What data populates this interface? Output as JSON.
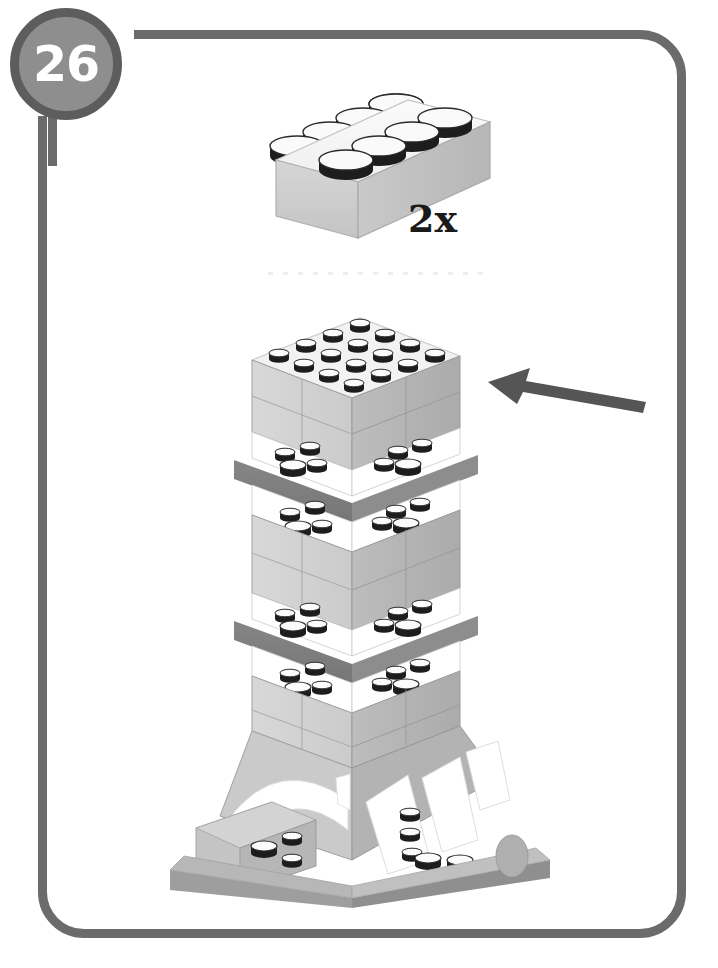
{
  "page": {
    "kind": "lego-building-instruction-step",
    "background_color": "#ffffff"
  },
  "frame": {
    "name": "rounded-step-frame",
    "color": "#6b6b6b",
    "stroke_width_px": 9,
    "corner_radius_px": 46
  },
  "step_badge": {
    "number": "26",
    "fill_color": "#8e8e8e",
    "ring_color": "#5d5d5d",
    "text_color": "#ffffff"
  },
  "parts_callout": {
    "quantity_label": "2x",
    "quantity_text_color": "#1a1a1a",
    "part": {
      "name": "brick-2x4",
      "studs_long": 4,
      "studs_wide": 2,
      "color_name": "light-gray",
      "body_color": "#cfcfcf",
      "top_color": "#f4f4f4",
      "stud_outline_color": "#141414"
    }
  },
  "separator": {
    "name": "dotted-divider",
    "color": "#eeeeee"
  },
  "arrow": {
    "name": "placement-arrow",
    "direction": "left",
    "color": "#555555",
    "points_to": "tower-top-section"
  },
  "assembly": {
    "name": "eiffel-tower-model",
    "top_section": {
      "stud_grid_rows": 4,
      "stud_grid_cols": 4,
      "top_plate_color": "#f2f2f2"
    },
    "band_levels": [
      {
        "label": "upper-platform-band",
        "color": "#7d7d7d"
      },
      {
        "label": "lower-platform-band",
        "color": "#7d7d7d"
      }
    ],
    "palette": {
      "face_light": "#d3d3d3",
      "face_mid": "#c2c2c2",
      "face_dark": "#a8a8a8",
      "face_darker": "#8f8f8f",
      "band_gray": "#7d7d7d",
      "outline": "#8a8a8a",
      "stud_black": "#1d1d1d",
      "white": "#ffffff"
    },
    "base": {
      "has_arches": true,
      "arch_count": 2,
      "baseplate_color": "#b5b5b5"
    }
  }
}
